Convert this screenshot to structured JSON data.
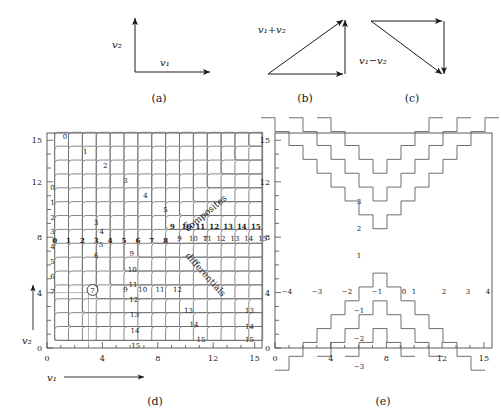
{
  "figure": {
    "panels": [
      {
        "id": "a",
        "caption": "(a)",
        "type": "axes",
        "labels": {
          "x": "v₁",
          "y": "v₂"
        }
      },
      {
        "id": "b",
        "caption": "(b)",
        "type": "triangle",
        "label": "v₁+v₂"
      },
      {
        "id": "c",
        "caption": "(c)",
        "type": "triangle",
        "label": "v₁−v₂"
      },
      {
        "id": "d",
        "caption": "(d)",
        "type": "lattice"
      },
      {
        "id": "e",
        "caption": "(e)",
        "type": "lattice"
      }
    ]
  },
  "panel_a": {
    "caption": "(a)",
    "x_label": "v₁",
    "y_label": "v₂"
  },
  "panel_b": {
    "caption": "(b)",
    "vector_label": "v₁+v₂"
  },
  "panel_c": {
    "caption": "(c)",
    "vector_label": "v₁−v₂"
  },
  "panel_d": {
    "caption": "(d)",
    "x_label": "v₁",
    "y_label": "v₂",
    "x_ticks": [
      "0",
      "4",
      "8",
      "12",
      "15"
    ],
    "y_ticks": [
      "0",
      "4",
      "8",
      "12",
      "15"
    ],
    "annotation_upper": "composites",
    "annotation_lower": "differentials",
    "highlight_value": "7",
    "highlight_circled": true,
    "axis_range": [
      0,
      15.5
    ],
    "row_bold_labels": [
      "0",
      "1",
      "2",
      "3",
      "4",
      "5",
      "6",
      "7",
      "8",
      "9",
      "10",
      "11",
      "12",
      "13",
      "14",
      "15"
    ],
    "column_labels": [
      "0",
      "1",
      "2",
      "3",
      "4",
      "5",
      "6",
      "7",
      "8",
      "9",
      "10",
      "11",
      "12",
      "13",
      "14",
      "15"
    ],
    "diag_labels": [
      "0",
      "1",
      "2",
      "3",
      "4",
      "5",
      "6",
      "7",
      "8",
      "9",
      "10",
      "11",
      "12",
      "13",
      "14",
      "15"
    ],
    "inner_column_labels": [
      "3",
      "4",
      "5",
      "6",
      "7",
      "8"
    ],
    "bottom_row_labels": [
      "8",
      "9",
      "10",
      "11",
      "12"
    ]
  },
  "panel_e": {
    "caption": "(e)",
    "x_ticks": [
      "0",
      "4",
      "8",
      "12",
      "15"
    ],
    "y_ticks": [
      "0",
      "4",
      "8",
      "12",
      "15"
    ],
    "axis_range": [
      0,
      15.5
    ],
    "level_labels_row": [
      "−4",
      "−3",
      "−2",
      "−1",
      "0",
      "1",
      "2",
      "3",
      "4"
    ],
    "level_labels_up": [
      "1",
      "2",
      "3"
    ],
    "level_labels_down": [
      "−1",
      "−2",
      "−3"
    ]
  },
  "chart_data": {
    "type": "line",
    "title": "",
    "charts": [
      {
        "id": "d",
        "description": "Lattice of level sets for v1+v2 (composites) and v1-v2 (differentials) over 0..15 grid",
        "xlabel": "v1",
        "ylabel": "v2",
        "xlim": [
          0,
          15.5
        ],
        "ylim": [
          0,
          15.5
        ],
        "xticks": [
          0,
          4,
          8,
          12,
          15
        ],
        "yticks": [
          0,
          4,
          8,
          12,
          15
        ],
        "contours_sum": [
          0,
          1,
          2,
          3,
          4,
          5,
          6,
          7,
          8,
          9,
          10,
          11,
          12,
          13,
          14,
          15
        ],
        "contours_diff": [
          0,
          1,
          2,
          3,
          4,
          5,
          6,
          7,
          8,
          9,
          10,
          11,
          12,
          13,
          14,
          15
        ],
        "marker": {
          "x": 3,
          "y": 4,
          "label": "7",
          "circled": true
        },
        "annotations": [
          "composites",
          "differentials"
        ],
        "grid": false,
        "legend": "none"
      },
      {
        "id": "e",
        "description": "Step contours of v1-v2 forming nested V shapes, levels -4..4",
        "xlabel": "",
        "ylabel": "",
        "xlim": [
          0,
          15.5
        ],
        "ylim": [
          0,
          15.5
        ],
        "xticks": [
          0,
          4,
          8,
          12,
          15
        ],
        "yticks": [
          0,
          4,
          8,
          12,
          15
        ],
        "levels": [
          -4,
          -3,
          -2,
          -1,
          0,
          1,
          2,
          3,
          4
        ],
        "grid": false,
        "legend": "none"
      }
    ]
  }
}
